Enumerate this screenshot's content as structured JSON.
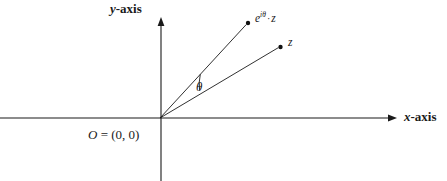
{
  "figure": {
    "background_color": "#ffffff",
    "stroke_color": "#1a1a1a"
  },
  "axes": {
    "x": {
      "label_var": "x",
      "label_word": "-axis",
      "separator": "",
      "origin_px": [
        160,
        118
      ],
      "start_px": [
        0,
        118
      ],
      "arrow_tip_px": [
        397,
        118
      ]
    },
    "y": {
      "label_var": "y",
      "label_word": "-axis",
      "origin_px": [
        160,
        118
      ],
      "arrow_tip_px": [
        161,
        18
      ],
      "end_px": [
        161,
        181
      ]
    }
  },
  "origin": {
    "label_var": "O",
    "label_rest": " = (0, 0)",
    "position_px": [
      160,
      118
    ]
  },
  "angle": {
    "symbol": "θ",
    "label_position_px": [
      202,
      88
    ],
    "arc_radius_px": 46
  },
  "points": [
    {
      "name": "rotated-point",
      "label_base": "e",
      "label_exponent": "iθ",
      "label_operator": "·",
      "label_operand": "z",
      "dot_px": [
        248,
        23
      ]
    },
    {
      "name": "z-point",
      "label": "z",
      "dot_px": [
        280,
        47
      ]
    }
  ],
  "rays": [
    {
      "name": "ray-to-rotated-point",
      "from_px": [
        160,
        118
      ],
      "to_px": [
        246,
        25
      ]
    },
    {
      "name": "ray-to-z",
      "from_px": [
        160,
        118
      ],
      "to_px": [
        278,
        48
      ]
    }
  ]
}
